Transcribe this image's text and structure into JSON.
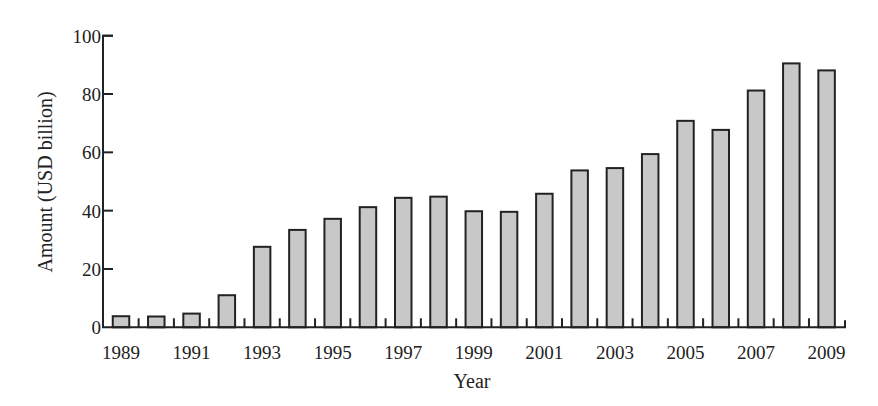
{
  "chart_data": {
    "type": "bar",
    "title": "",
    "xlabel": "Year",
    "ylabel": "Amount (USD billion)",
    "ylim": [
      0,
      100
    ],
    "yticks": [
      0,
      20,
      40,
      60,
      80,
      100
    ],
    "xtick_labels": [
      "1989",
      "1991",
      "1993",
      "1995",
      "1997",
      "1999",
      "2001",
      "2003",
      "2005",
      "2007",
      "2009"
    ],
    "grid": false,
    "legend": null,
    "bar_color": "#c8c8c8",
    "edge_color": "#222222",
    "categories": [
      "1989",
      "1990",
      "1991",
      "1992",
      "1993",
      "1994",
      "1995",
      "1996",
      "1997",
      "1998",
      "1999",
      "2000",
      "2001",
      "2002",
      "2003",
      "2004",
      "2005",
      "2006",
      "2007",
      "2008",
      "2009"
    ],
    "values": [
      3.8,
      3.7,
      4.7,
      11.0,
      27.6,
      33.4,
      37.2,
      41.2,
      44.4,
      44.8,
      39.8,
      39.6,
      45.8,
      53.8,
      54.6,
      59.4,
      70.8,
      67.7,
      81.2,
      90.5,
      88.1
    ]
  }
}
